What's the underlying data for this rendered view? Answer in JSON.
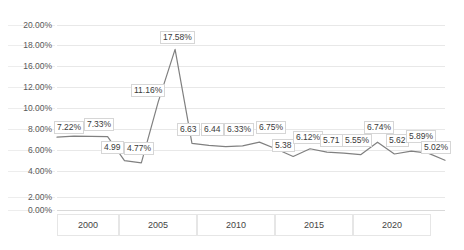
{
  "chart_data": {
    "type": "line",
    "title": "",
    "xlabel": "",
    "ylabel": "",
    "grid": true,
    "legend": "none",
    "line_color": "#808080",
    "x_tick_labels": [
      "2000",
      "2005",
      "2010",
      "2015",
      "2020"
    ],
    "y_tick_labels": [
      "20.00%",
      "18.00%",
      "16.00%",
      "12.00%",
      "10.00%",
      "8.00%",
      "6.00%",
      "4.00%",
      "2.00%",
      "0.00%"
    ],
    "ylim": [
      0,
      20
    ],
    "points": [
      {
        "x": 1998,
        "value": 7.22,
        "label": "7.22%"
      },
      {
        "x": 1999,
        "value": 7.33,
        "label": "7.33%"
      },
      {
        "x": 2000,
        "value": 7.3,
        "label": ""
      },
      {
        "x": 2001,
        "value": 7.28,
        "label": ""
      },
      {
        "x": 2002,
        "value": 4.99,
        "label": "4.99"
      },
      {
        "x": 2003,
        "value": 4.77,
        "label": "4.77%"
      },
      {
        "x": 2004,
        "value": 11.16,
        "label": "11.16%"
      },
      {
        "x": 2005,
        "value": 17.58,
        "label": "17.58%"
      },
      {
        "x": 2006,
        "value": 6.63,
        "label": "6.63"
      },
      {
        "x": 2007,
        "value": 6.44,
        "label": "6.44"
      },
      {
        "x": 2008,
        "value": 6.33,
        "label": "6.33%"
      },
      {
        "x": 2009,
        "value": 6.4,
        "label": ""
      },
      {
        "x": 2010,
        "value": 6.75,
        "label": "6.75%"
      },
      {
        "x": 2011,
        "value": 6.1,
        "label": ""
      },
      {
        "x": 2012,
        "value": 5.38,
        "label": "5.38"
      },
      {
        "x": 2013,
        "value": 6.12,
        "label": "6.12%"
      },
      {
        "x": 2014,
        "value": 5.8,
        "label": ""
      },
      {
        "x": 2015,
        "value": 5.71,
        "label": "5.71"
      },
      {
        "x": 2016,
        "value": 5.55,
        "label": "5.55%"
      },
      {
        "x": 2017,
        "value": 6.74,
        "label": "6.74%"
      },
      {
        "x": 2018,
        "value": 5.62,
        "label": "5.62"
      },
      {
        "x": 2019,
        "value": 5.89,
        "label": "5.89%"
      },
      {
        "x": 2020,
        "value": 5.7,
        "label": ""
      },
      {
        "x": 2021,
        "value": 5.02,
        "label": "5.02%"
      }
    ],
    "data_labels": [
      "7.22%",
      "7.33%",
      "4.99",
      "4.77%",
      "11.16%",
      "17.58%",
      "6.63",
      "6.44",
      "6.33%",
      "6.75%",
      "5.38",
      "6.12%",
      "5.71",
      "5.55%",
      "6.74%",
      "5.62",
      "5.89%",
      "5.02%"
    ]
  },
  "axis": {
    "y": [
      {
        "text": "20.00%"
      },
      {
        "text": "18.00%"
      },
      {
        "text": "16.00%"
      },
      {
        "text": "12.00%"
      },
      {
        "text": "10.00%"
      },
      {
        "text": "8.00%"
      },
      {
        "text": "6.00%"
      },
      {
        "text": "4.00%"
      },
      {
        "text": "2.00%"
      },
      {
        "text": "0.00%"
      }
    ],
    "x": [
      {
        "text": "2000"
      },
      {
        "text": "2005"
      },
      {
        "text": "2010"
      },
      {
        "text": "2015"
      },
      {
        "text": "2020"
      }
    ]
  },
  "labels": {
    "l0": "7.22%",
    "l1": "7.33%",
    "l2": "4.99",
    "l3": "4.77%",
    "l4": "11.16%",
    "l5": "17.58%",
    "l6": "6.63",
    "l7": "6.44",
    "l8": "6.33%",
    "l9": "6.75%",
    "l10": "5.38",
    "l11": "6.12%",
    "l12": "5.71",
    "l13": "5.55%",
    "l14": "6.74%",
    "l15": "5.62",
    "l16": "5.89%",
    "l17": "5.02%"
  }
}
